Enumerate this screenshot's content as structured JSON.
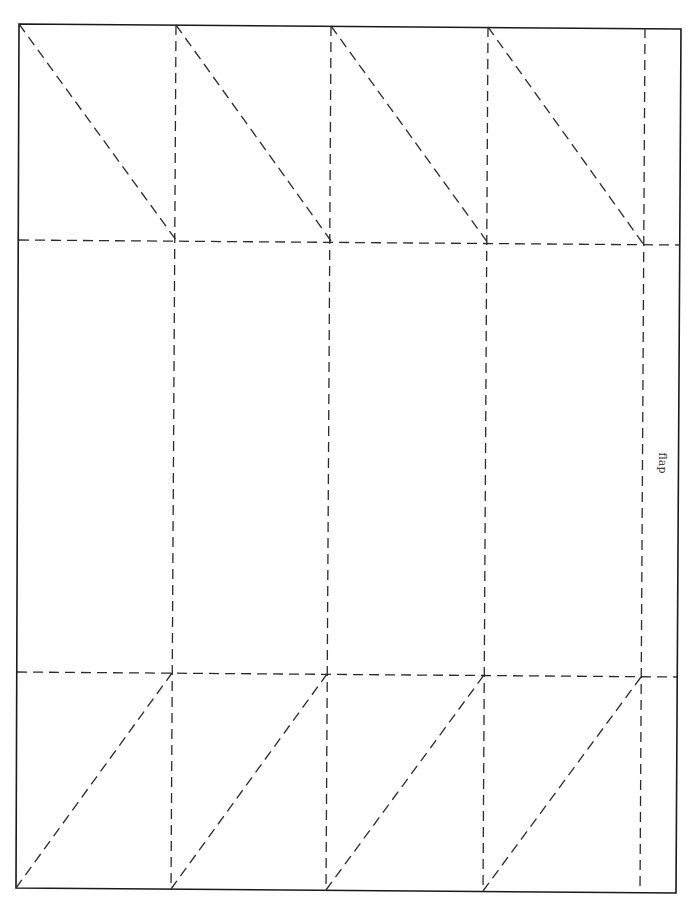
{
  "diagram": {
    "type": "papercraft-box-template",
    "outline": {
      "points": [
        [
          19,
          24
        ],
        [
          681,
          29
        ],
        [
          676,
          893
        ],
        [
          16,
          888
        ]
      ],
      "stroke_color": "#1a1a1a"
    },
    "fold_line_color": "#2a2a2a",
    "horizontal_folds": [
      {
        "from": [
          19,
          240
        ],
        "to": [
          680,
          245
        ]
      },
      {
        "from": [
          17,
          672
        ],
        "to": [
          677,
          677
        ]
      }
    ],
    "vertical_folds": [
      {
        "from": [
          176,
          25
        ],
        "to": [
          171,
          889
        ]
      },
      {
        "from": [
          331,
          26
        ],
        "to": [
          326,
          890
        ]
      },
      {
        "from": [
          488,
          27
        ],
        "to": [
          483,
          891
        ]
      },
      {
        "from": [
          645,
          28
        ],
        "to": [
          640,
          892
        ]
      }
    ],
    "top_diagonals": [
      {
        "from": [
          19,
          24
        ],
        "to": [
          176,
          240
        ]
      },
      {
        "from": [
          176,
          25
        ],
        "to": [
          331,
          241
        ]
      },
      {
        "from": [
          331,
          26
        ],
        "to": [
          488,
          243
        ]
      },
      {
        "from": [
          488,
          27
        ],
        "to": [
          644,
          245
        ]
      }
    ],
    "bottom_diagonals": [
      {
        "from": [
          16,
          888
        ],
        "to": [
          172,
          673
        ]
      },
      {
        "from": [
          171,
          889
        ],
        "to": [
          327,
          674
        ]
      },
      {
        "from": [
          326,
          890
        ],
        "to": [
          484,
          675
        ]
      },
      {
        "from": [
          483,
          891
        ],
        "to": [
          641,
          677
        ]
      }
    ],
    "labels": [
      {
        "text": "flap",
        "x": 662,
        "y": 463,
        "rotation": 90
      }
    ]
  }
}
